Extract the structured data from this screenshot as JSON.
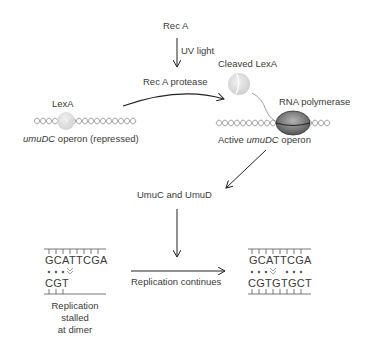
{
  "title_nodes": {
    "rec_a": "Rec A",
    "uv_light": "UV light",
    "rec_a_protease": "Rec A protease",
    "cleaved_lexa": "Cleaved LexA",
    "lexa": "LexA",
    "rna_polymerase": "RNA polymerase",
    "umudc_repressed_gene": "umuDC",
    "umudc_repressed_suffix": " operon (repressed)",
    "active_prefix": "Active ",
    "active_gene": "umuDC",
    "active_suffix": " operon",
    "umuc_umud": "UmuC and UmuD",
    "replication_continues": "Replication continues",
    "stalled_line1": "Replication",
    "stalled_line2": "stalled",
    "stalled_line3": "at dimer"
  },
  "dna": {
    "stalled": {
      "top": "GCATTCGA",
      "bottom": "CGT"
    },
    "continued": {
      "top": "GCATTCGA",
      "bottom": "CGTGTGCT"
    }
  },
  "colors": {
    "text": "#3a3a3a",
    "arrow": "#222222",
    "helix": "#8a8a8a",
    "protein_light": "#e0e0e0",
    "polymerase": "#7a7a7a"
  }
}
